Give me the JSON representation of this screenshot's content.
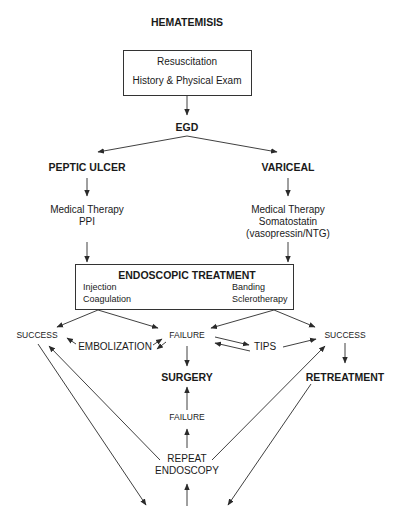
{
  "title": "HEMATEMISIS",
  "top_box": {
    "line1": "Resuscitation",
    "line2": "History & Physical Exam"
  },
  "egd": "EGD",
  "left_branch": {
    "title": "PEPTIC ULCER",
    "therapy_line1": "Medical Therapy",
    "therapy_line2": "PPI"
  },
  "right_branch": {
    "title": "VARICEAL",
    "therapy_line1": "Medical Therapy",
    "therapy_line2": "Somatostatin",
    "therapy_line3": "(vasopressin/NTG)"
  },
  "endoscopic_box": {
    "title": "ENDOSCOPIC TREATMENT",
    "left_items": [
      "Injection",
      "Coagulation"
    ],
    "right_items": [
      "Banding",
      "Sclerotherapy"
    ]
  },
  "outcomes": {
    "success_left": "SUCCESS",
    "failure": "FAILURE",
    "success_right": "SUCCESS",
    "embolization": "EMBOLIZATION",
    "tips": "TIPS",
    "surgery": "SURGERY",
    "retreatment": "RETREATMENT",
    "failure2": "FAILURE",
    "repeat_line1": "REPEAT",
    "repeat_line2": "ENDOSCOPY"
  },
  "colors": {
    "line": "#2a2a2a",
    "text": "#1a1a1a",
    "background": "#ffffff"
  }
}
